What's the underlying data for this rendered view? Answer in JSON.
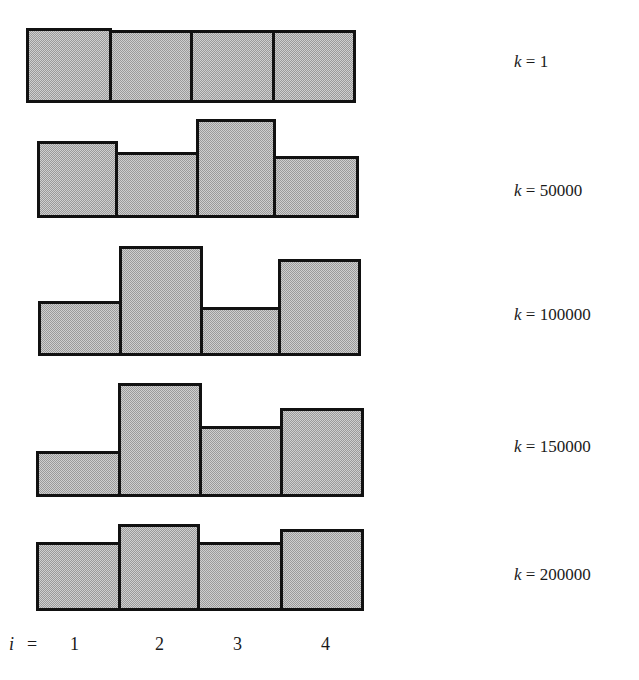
{
  "chart_data": {
    "type": "bar",
    "title": "",
    "categories": [
      "1",
      "2",
      "3",
      "4"
    ],
    "xlabel": "i",
    "x_prefix": "i =",
    "ylabel": "",
    "grid": false,
    "legend": "none",
    "series": [
      {
        "name": "k = 1",
        "var": "k",
        "value": "1",
        "values": [
          74,
          72,
          72,
          72
        ],
        "rect": {
          "top": [
            28,
            30,
            30,
            30
          ],
          "bottom": 103,
          "x": [
            26,
            109,
            190,
            272,
            353
          ]
        }
      },
      {
        "name": "k = 50000",
        "var": "k",
        "value": "50000",
        "values": [
          76,
          65,
          98,
          61
        ],
        "rect": {
          "top": [
            141,
            152,
            119,
            156
          ],
          "bottom": 218,
          "x": [
            37,
            115,
            196,
            273,
            356
          ]
        }
      },
      {
        "name": "k = 100000",
        "var": "k",
        "value": "100000",
        "values": [
          54,
          109,
          48,
          96
        ],
        "rect": {
          "top": [
            301,
            246,
            307,
            259
          ],
          "bottom": 356,
          "x": [
            38,
            119,
            200,
            278,
            358
          ]
        }
      },
      {
        "name": "k = 150000",
        "var": "k",
        "value": "150000",
        "values": [
          45,
          113,
          70,
          88
        ],
        "rect": {
          "top": [
            451,
            383,
            426,
            408
          ],
          "bottom": 497,
          "x": [
            36,
            118,
            199,
            280,
            361
          ]
        }
      },
      {
        "name": "k = 200000",
        "var": "k",
        "value": "200000",
        "values": [
          68,
          86,
          68,
          81
        ],
        "rect": {
          "top": [
            542,
            524,
            542,
            529
          ],
          "bottom": 611,
          "x": [
            36,
            118,
            197,
            280,
            361
          ]
        }
      }
    ],
    "label_y": [
      62,
      191,
      315,
      447,
      575
    ],
    "x_tick_positions": [
      75,
      160,
      238,
      326
    ],
    "colors": {
      "fill": "#c8c8c8",
      "border": "#111111"
    }
  }
}
